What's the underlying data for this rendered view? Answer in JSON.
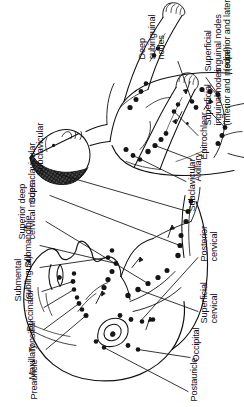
{
  "figure": {
    "type": "medical-illustration",
    "orientation_degrees": -90,
    "background_color": "#ffffff",
    "ink_color": "#111111",
    "views": [
      {
        "name": "head-and-neck-detail",
        "description": "Enlarged lateral head and neck showing cervical and facial lymph node chains"
      },
      {
        "name": "whole-body-figure",
        "description": "Full body anterior figure showing axillary, epitrochlear and inguinal lymph node groups"
      }
    ]
  },
  "labels": {
    "head_neck": [
      {
        "id": "preauricle",
        "text": "Preauricle"
      },
      {
        "id": "maxillary",
        "text": "Maxillary"
      },
      {
        "id": "tonsillar",
        "text": "Tonsillar"
      },
      {
        "id": "buccinator",
        "text": "Buccinator"
      },
      {
        "id": "submental",
        "text": "Submental\n(sublingual)"
      },
      {
        "id": "submandible",
        "text": "Submandible"
      },
      {
        "id": "superior-deep-cervical",
        "text": "Superior deep\ncervical nodes"
      },
      {
        "id": "supraclavicular",
        "text": "Supraclavicular"
      },
      {
        "id": "subclavicular-neck",
        "text": "Subclavicular"
      },
      {
        "id": "postauricle",
        "text": "Postauricle"
      },
      {
        "id": "occipital",
        "text": "Occipital"
      },
      {
        "id": "superficial-cervical",
        "text": "Superficial\ncervical"
      },
      {
        "id": "posterior-cervical",
        "text": "Posterior\ncervical"
      }
    ],
    "body": [
      {
        "id": "subclavicular-body",
        "text": "Subclavicular"
      },
      {
        "id": "axillary",
        "text": "Axillary"
      },
      {
        "id": "epitrochlear",
        "text": "Epitrochlear"
      },
      {
        "id": "superficial-inguinal-inferior-medial",
        "text": "Superficial\ninguinal nodes\n(inferior and medial)"
      },
      {
        "id": "superficial-inguinal-superior-lateral",
        "text": "Superficial\ninguinal nodes\n(superior and lateral)"
      },
      {
        "id": "deep-subinguinal",
        "text": "Deep\nsubinguinal\nnodes"
      }
    ]
  }
}
